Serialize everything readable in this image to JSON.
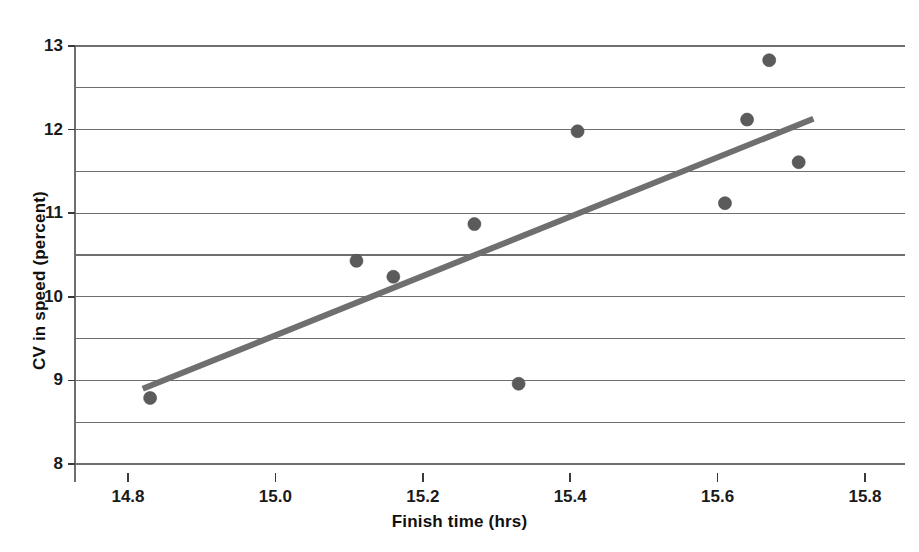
{
  "chart_data": {
    "type": "scatter",
    "title": "",
    "xlabel": "Finish time (hrs)",
    "ylabel": "CV in speed (percent)",
    "xlim": [
      14.75,
      15.82
    ],
    "ylim": [
      8,
      13
    ],
    "xticks": [
      "14.8",
      "15.0",
      "15.2",
      "15.4",
      "15.6",
      "15.8"
    ],
    "xtick_values": [
      14.8,
      15.0,
      15.2,
      15.4,
      15.6,
      15.8
    ],
    "yticks": [
      "8",
      "9",
      "10",
      "11",
      "12",
      "13"
    ],
    "ytick_values": [
      8,
      9,
      10,
      11,
      12,
      13
    ],
    "minor_gridline_values": [
      8.5,
      9.5,
      10.5,
      11.5,
      12.5
    ],
    "grid": true,
    "grid_color": "#6e6e6e",
    "legend": "none",
    "marker_color": "#5b5b5b",
    "marker_size": 13,
    "points": [
      {
        "x": 14.83,
        "y": 8.79
      },
      {
        "x": 15.11,
        "y": 10.43
      },
      {
        "x": 15.16,
        "y": 10.24
      },
      {
        "x": 15.27,
        "y": 10.87
      },
      {
        "x": 15.33,
        "y": 8.96
      },
      {
        "x": 15.41,
        "y": 11.98
      },
      {
        "x": 15.61,
        "y": 11.12
      },
      {
        "x": 15.64,
        "y": 12.12
      },
      {
        "x": 15.67,
        "y": 12.83
      },
      {
        "x": 15.71,
        "y": 11.61
      }
    ],
    "trendline": {
      "type": "linear-fit",
      "color": "#6f6f6f",
      "width": 6,
      "x_start": 14.82,
      "y_start": 8.9,
      "x_end": 15.73,
      "y_end": 12.13
    }
  },
  "axes": {
    "x_title": "Finish time (hrs)",
    "y_title": "CV in speed (percent)"
  }
}
